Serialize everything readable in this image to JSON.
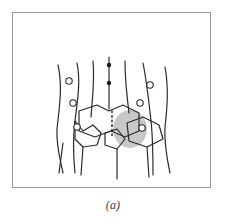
{
  "figure": {
    "caption": "(a)",
    "frame": {
      "border_color": "#9a9a9a",
      "background_color": "#ffffff",
      "x": 12,
      "y": 12,
      "width": 199,
      "height": 176
    }
  },
  "drawing": {
    "type": "line-sketch",
    "title": "",
    "ink_color": "#2b2b2b",
    "shading_color": "#c8c8c8",
    "marker_fill_open": "#ffffff",
    "marker_fill_solid": "#1a1a1a",
    "stroke_width": 1.2,
    "contour_lines": [
      {
        "name": "outer-left-contour",
        "d": "M 45 52 C 50 74, 46 96, 44 116 C 43 132, 47 146, 50 160"
      },
      {
        "name": "inner-left-contour",
        "d": "M 64 50 C 68 70, 64 90, 62 108 C 60 124, 60 140, 62 160"
      },
      {
        "name": "left-mid-contour",
        "d": "M 80 48 C 82 68, 79 88, 78 104"
      },
      {
        "name": "center-axis",
        "d": "M 96 44 L 96 96"
      },
      {
        "name": "right-mid-contour",
        "d": "M 112 48 C 112 66, 114 84, 116 100"
      },
      {
        "name": "inner-right-contour",
        "d": "M 130 50 C 134 70, 136 90, 138 108 C 140 126, 140 144, 140 162"
      },
      {
        "name": "outer-right-contour",
        "d": "M 152 54 C 156 76, 154 96, 152 114 C 151 130, 154 146, 157 160"
      }
    ],
    "band_outline": {
      "name": "central-band",
      "d": "M 66 98 L 84 92 L 96 98 L 110 92 L 126 100 L 126 118 L 112 124 L 98 118 L 82 124 L 66 118 Z"
    },
    "lower_outlines": [
      {
        "name": "lower-left-panel",
        "d": "M 62 108 L 70 118 L 80 112 L 88 120 L 84 132 L 70 134 L 62 126 Z"
      },
      {
        "name": "lower-right-panel",
        "d": "M 114 110 L 130 104 L 146 112 L 150 126 L 134 134 L 116 128 Z"
      },
      {
        "name": "lower-center-wedge",
        "d": "M 92 120 L 104 116 L 112 126 L 104 136 L 92 132 Z"
      }
    ],
    "dotted_seam": {
      "name": "dotted-seam-line",
      "x": 99,
      "y_start": 98,
      "y_end": 124,
      "dot_count": 7,
      "dash_pattern": "1.6 3"
    },
    "shaded_region": {
      "name": "gray-shaded-patch",
      "shape": "ellipse",
      "cx": 117,
      "cy": 116,
      "rx": 17,
      "ry": 19,
      "color": "#c8c8c8"
    },
    "open_markers": [
      {
        "name": "open-circle-left-1",
        "cx": 56,
        "cy": 68,
        "r": 3.2
      },
      {
        "name": "open-circle-left-2",
        "cx": 60,
        "cy": 90,
        "r": 3.2
      },
      {
        "name": "open-circle-left-3",
        "cx": 64,
        "cy": 114,
        "r": 3.2
      },
      {
        "name": "open-circle-right-1",
        "cx": 137,
        "cy": 72,
        "r": 3.2
      },
      {
        "name": "open-circle-right-2",
        "cx": 127,
        "cy": 90,
        "r": 3.2
      },
      {
        "name": "open-circle-right-3",
        "cx": 129,
        "cy": 115,
        "r": 3.2
      }
    ],
    "solid_markers": [
      {
        "name": "solid-dot-upper",
        "cx": 96,
        "cy": 52,
        "r": 2.2
      },
      {
        "name": "solid-dot-lower",
        "cx": 96,
        "cy": 70,
        "r": 2.2
      }
    ],
    "tails": [
      {
        "name": "tail-left",
        "d": "M 70 134 L 68 162"
      },
      {
        "name": "tail-center",
        "d": "M 104 136 L 104 166"
      },
      {
        "name": "tail-right",
        "d": "M 134 134 L 136 164"
      },
      {
        "name": "tail-far-left",
        "d": "M 50 130 L 46 160"
      }
    ]
  }
}
